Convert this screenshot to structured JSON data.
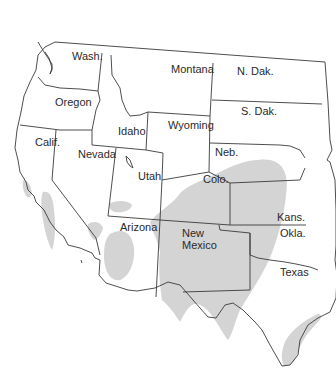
{
  "map": {
    "shade_color": "#d4d4d4",
    "line_color": "#3a3a3a",
    "states": [
      {
        "id": "wash",
        "label": "Wash.",
        "x": 72,
        "y": 50
      },
      {
        "id": "oregon",
        "label": "Oregon",
        "x": 55,
        "y": 96
      },
      {
        "id": "idaho",
        "label": "Idaho",
        "x": 118,
        "y": 125
      },
      {
        "id": "montana",
        "label": "Montana",
        "x": 171,
        "y": 63
      },
      {
        "id": "n-dak",
        "label": "N. Dak.",
        "x": 237,
        "y": 65
      },
      {
        "id": "s-dak",
        "label": "S. Dak.",
        "x": 241,
        "y": 105
      },
      {
        "id": "wyoming",
        "label": "Wyoming",
        "x": 168,
        "y": 119
      },
      {
        "id": "neb",
        "label": "Neb.",
        "x": 215,
        "y": 146
      },
      {
        "id": "calif",
        "label": "Calif.",
        "x": 35,
        "y": 136
      },
      {
        "id": "nevada",
        "label": "Nevada",
        "x": 78,
        "y": 148
      },
      {
        "id": "utah",
        "label": "Utah",
        "x": 138,
        "y": 170
      },
      {
        "id": "colo",
        "label": "Colo.",
        "x": 203,
        "y": 173
      },
      {
        "id": "kans",
        "label": "Kans.",
        "x": 277,
        "y": 211
      },
      {
        "id": "okla",
        "label": "Okla.",
        "x": 280,
        "y": 227
      },
      {
        "id": "arizona",
        "label": "Arizona",
        "x": 120,
        "y": 221
      },
      {
        "id": "new-mexico",
        "label": "New Mexico",
        "x": 182,
        "y": 227
      },
      {
        "id": "texas",
        "label": "Texas",
        "x": 280,
        "y": 266
      }
    ]
  }
}
